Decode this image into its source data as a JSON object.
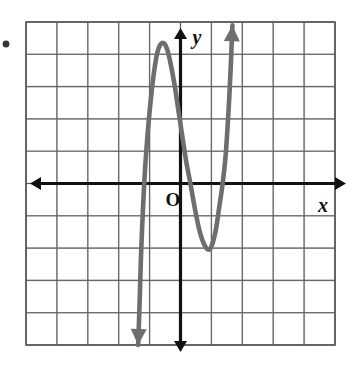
{
  "figure": {
    "bullet_marker": "•",
    "origin_label": "O",
    "x_axis_label": "x",
    "y_axis_label": "y"
  },
  "colors": {
    "grid_major": "#5a5a5a",
    "grid_minor": "#b8b8b8",
    "axis": "#111111",
    "curve": "#6e6e6e",
    "paper": "#ffffff",
    "text": "#111111"
  },
  "chart_data": {
    "type": "line",
    "title": "",
    "xlabel": "x",
    "ylabel": "y",
    "grid": true,
    "legend": null,
    "xlim": [
      -5,
      5
    ],
    "ylim": [
      -5,
      5
    ],
    "xticks": [
      -5,
      -4,
      -3,
      -2,
      -1,
      0,
      1,
      2,
      3,
      4,
      5
    ],
    "yticks": [
      -5,
      -4,
      -3,
      -2,
      -1,
      0,
      1,
      2,
      3,
      4,
      5
    ],
    "tick_labels_shown": false,
    "grid_columns": 10,
    "grid_rows": 10,
    "series": [
      {
        "name": "cubic curve",
        "description": "Cubic polynomial with three real x-intercepts; falls to the lower left and rises to the upper right",
        "x_intercepts": [
          -1.3,
          0.3,
          1.45
        ],
        "local_maximum": [
          -0.55,
          4.35
        ],
        "local_minimum": [
          0.9,
          -2.05
        ],
        "end_behavior_left": "decreasing to negative infinity",
        "end_behavior_right": "increasing to positive infinity",
        "arrow_start": [
          -1.35,
          -5.0
        ],
        "arrow_end": [
          1.7,
          5.0
        ],
        "points": [
          [
            -1.37,
            -5.0
          ],
          [
            -1.32,
            -3.6
          ],
          [
            -1.28,
            -2.3
          ],
          [
            -1.22,
            -0.9
          ],
          [
            -1.15,
            0.4
          ],
          [
            -1.05,
            1.7
          ],
          [
            -0.95,
            2.7
          ],
          [
            -0.85,
            3.5
          ],
          [
            -0.75,
            4.05
          ],
          [
            -0.65,
            4.3
          ],
          [
            -0.55,
            4.35
          ],
          [
            -0.45,
            4.2
          ],
          [
            -0.35,
            3.85
          ],
          [
            -0.2,
            3.1
          ],
          [
            -0.05,
            2.15
          ],
          [
            0.1,
            1.2
          ],
          [
            0.2,
            0.6
          ],
          [
            0.32,
            0.0
          ],
          [
            0.45,
            -0.7
          ],
          [
            0.6,
            -1.4
          ],
          [
            0.75,
            -1.85
          ],
          [
            0.9,
            -2.05
          ],
          [
            1.02,
            -1.9
          ],
          [
            1.15,
            -1.4
          ],
          [
            1.25,
            -0.75
          ],
          [
            1.35,
            -0.1
          ],
          [
            1.45,
            0.75
          ],
          [
            1.52,
            1.7
          ],
          [
            1.58,
            2.7
          ],
          [
            1.63,
            3.7
          ],
          [
            1.68,
            4.9
          ]
        ]
      }
    ]
  }
}
